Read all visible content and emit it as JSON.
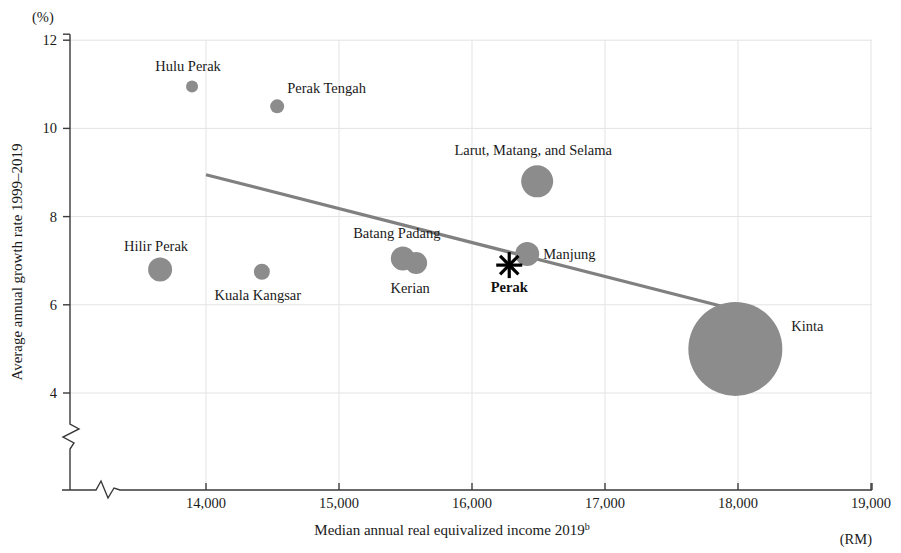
{
  "chart_data": {
    "type": "scatter",
    "title": "",
    "subtitle": "",
    "xlabel": "Median annual real equivalized income 2019",
    "xlabel_superscript": "b",
    "ylabel": "Average annual growth rate 1999–2019",
    "x_unit_label": "(RM)",
    "y_unit_label": "(%)",
    "xlim": [
      13400,
      19000
    ],
    "ylim": [
      3.2,
      12
    ],
    "x_axis_broken": true,
    "y_axis_broken": true,
    "grid": true,
    "legend": "none",
    "xticks": [
      14000,
      15000,
      16000,
      17000,
      18000,
      19000
    ],
    "xtick_labels": [
      "14,000",
      "15,000",
      "16,000",
      "17,000",
      "18,000",
      "19,000"
    ],
    "yticks": [
      4,
      6,
      8,
      10,
      12
    ],
    "ytick_labels": [
      "4",
      "6",
      "8",
      "10",
      "12"
    ],
    "bubble_color": "#8c8c8c",
    "trend_color": "#808080",
    "marker_color": "#000000",
    "points": [
      {
        "name": "Hulu Perak",
        "x": 13895,
        "y": 10.95,
        "size": 6,
        "label_dx": -4,
        "label_dy": -16,
        "label_anchor": "middle",
        "bold": false
      },
      {
        "name": "Perak Tengah",
        "x": 14535,
        "y": 10.5,
        "size": 7,
        "label_dx": 10,
        "label_dy": -13,
        "label_anchor": "start",
        "bold": false
      },
      {
        "name": "Larut, Matang, and Selama",
        "x": 16490,
        "y": 8.8,
        "size": 16,
        "label_dx": -4,
        "label_dy": -26,
        "label_anchor": "middle",
        "bold": false
      },
      {
        "name": "Manjung",
        "x": 16415,
        "y": 7.15,
        "size": 12,
        "label_dx": 16,
        "label_dy": 5,
        "label_anchor": "start",
        "bold": false
      },
      {
        "name": "Batang Padang",
        "x": 15480,
        "y": 7.05,
        "size": 12,
        "label_dx": -6,
        "label_dy": -20,
        "label_anchor": "middle",
        "bold": false
      },
      {
        "name": "Kerian",
        "x": 15580,
        "y": 6.95,
        "size": 11,
        "label_dx": -6,
        "label_dy": 30,
        "label_anchor": "middle",
        "bold": false
      },
      {
        "name": "Hilir Perak",
        "x": 13655,
        "y": 6.8,
        "size": 12,
        "label_dx": -4,
        "label_dy": -19,
        "label_anchor": "middle",
        "bold": false
      },
      {
        "name": "Kuala Kangsar",
        "x": 14420,
        "y": 6.75,
        "size": 8,
        "label_dx": -4,
        "label_dy": 28,
        "label_anchor": "middle",
        "bold": false
      },
      {
        "name": "Kinta",
        "x": 17980,
        "y": 5.0,
        "size": 47,
        "label_dx": 56,
        "label_dy": -18,
        "label_anchor": "start",
        "bold": false
      }
    ],
    "reference_marker": {
      "name": "Perak",
      "x": 16280,
      "y": 6.9,
      "symbol": "asterisk",
      "label_dx": 0,
      "label_dy": 27,
      "label_anchor": "middle",
      "bold": true
    },
    "trendline": {
      "x_start": 14000,
      "y_start": 8.95,
      "x_end": 17900,
      "y_end": 5.95
    },
    "annotations": []
  }
}
